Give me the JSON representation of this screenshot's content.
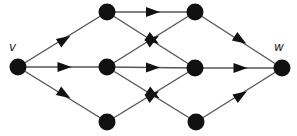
{
  "diagram": {
    "type": "directed-graph",
    "colors": {
      "node": "#111111",
      "edge": "#555555",
      "arrow": "#111111"
    },
    "nodes": [
      {
        "id": "v",
        "label": "v",
        "x": 18,
        "y": 67
      },
      {
        "id": "a",
        "label": "",
        "x": 107,
        "y": 12
      },
      {
        "id": "b",
        "label": "",
        "x": 107,
        "y": 67
      },
      {
        "id": "c",
        "label": "",
        "x": 107,
        "y": 122
      },
      {
        "id": "d",
        "label": "",
        "x": 195,
        "y": 12
      },
      {
        "id": "e",
        "label": "",
        "x": 195,
        "y": 68
      },
      {
        "id": "f",
        "label": "",
        "x": 196,
        "y": 122
      },
      {
        "id": "w",
        "label": "w",
        "x": 282,
        "y": 68
      }
    ],
    "edges": [
      {
        "from": "v",
        "to": "a"
      },
      {
        "from": "v",
        "to": "b"
      },
      {
        "from": "v",
        "to": "c"
      },
      {
        "from": "a",
        "to": "d"
      },
      {
        "from": "a",
        "to": "e"
      },
      {
        "from": "b",
        "to": "d"
      },
      {
        "from": "b",
        "to": "e"
      },
      {
        "from": "b",
        "to": "f"
      },
      {
        "from": "c",
        "to": "e"
      },
      {
        "from": "d",
        "to": "w"
      },
      {
        "from": "e",
        "to": "w"
      },
      {
        "from": "f",
        "to": "w"
      }
    ]
  },
  "labels": {
    "source": "v",
    "sink": "w"
  }
}
